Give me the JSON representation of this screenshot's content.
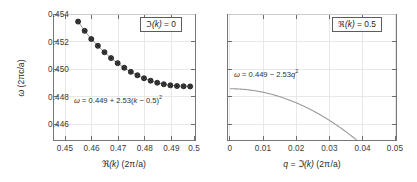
{
  "figure": {
    "background_color": "#ffffff",
    "frame_color": "#767676",
    "grid_color": "#e2e2e2",
    "marker_color": "#4a4a4a",
    "curve_color": "#9a9a9a"
  },
  "panels": {
    "left": {
      "legend_label": "ℑ(k) = 0",
      "equation": "ω = 0.449 + 2.53(k − 0.5)²",
      "xlabel_parts": {
        "frak": "ℜ",
        "rest": "(k) (2π /a)"
      },
      "xlabel": "ℜ(k) (2π /a)",
      "ylabel": "ω (2πc/a)",
      "xticks": [
        "0.45",
        "0.46",
        "0.47",
        "0.48",
        "0.49",
        "0.5"
      ],
      "yticks": [
        "0.446",
        "0.448",
        "0.450",
        "0.452",
        "0.454"
      ]
    },
    "right": {
      "legend_label": "ℜ(k) = 0.5",
      "equation": "ω = 0.449 − 2.53q²",
      "xlabel": "q = ℑ(k) (2π /a)",
      "ylabel": "",
      "xticks": [
        "0",
        "0.01",
        "0.02",
        "0.03",
        "0.04",
        "0.05"
      ],
      "yticks": [
        "",
        "",
        "",
        "",
        ""
      ]
    }
  },
  "chart_data": [
    {
      "type": "scatter",
      "title": "",
      "subtitle": "",
      "xlabel": "ℜ(k) (2π /a)",
      "ylabel": "ω (2πc/a)",
      "xlim": [
        0.4455,
        0.5015
      ],
      "ylim": [
        0.4452,
        0.45445
      ],
      "xticks": [
        0.45,
        0.46,
        0.47,
        0.48,
        0.49,
        0.5
      ],
      "yticks": [
        0.446,
        0.448,
        0.45,
        0.452,
        0.454
      ],
      "grid": true,
      "legend_position": "top-right",
      "legend_entries": [
        "ℑ(k) = 0"
      ],
      "annotations": [
        "ω = 0.449 + 2.53(k − 0.5)²"
      ],
      "fit_formula": "omega = 0.449 + 2.53*(k-0.5)^2",
      "series": [
        {
          "name": "dispersion",
          "marker": "filled-circle-with-cross",
          "x": [
            0.4552,
            0.4578,
            0.4604,
            0.463,
            0.4656,
            0.4682,
            0.4708,
            0.4734,
            0.476,
            0.4786,
            0.4812,
            0.4838,
            0.4864,
            0.489,
            0.4916,
            0.4942,
            0.4968,
            0.4994
          ],
          "y": [
            0.45393,
            0.45325,
            0.45265,
            0.45215,
            0.45168,
            0.45125,
            0.45088,
            0.45054,
            0.45024,
            0.44999,
            0.44977,
            0.44959,
            0.44944,
            0.44933,
            0.44925,
            0.4492,
            0.44918,
            0.44917
          ]
        }
      ]
    },
    {
      "type": "line",
      "title": "",
      "subtitle": "",
      "xlabel": "q = ℑ(k) (2π /a)",
      "ylabel": "",
      "xlim": [
        -0.0007,
        0.0507
      ],
      "ylim": [
        0.4452,
        0.45445
      ],
      "xticks": [
        0,
        0.01,
        0.02,
        0.03,
        0.04,
        0.05
      ],
      "yticks": [
        0.446,
        0.448,
        0.45,
        0.452,
        0.454
      ],
      "grid": true,
      "legend_position": "top-right",
      "legend_entries": [
        "ℜ(k) = 0.5"
      ],
      "annotations": [
        "ω = 0.449 − 2.53q²"
      ],
      "fit_formula": "omega = 0.449 - 2.53*q^2",
      "series": [
        {
          "name": "evanescent-branch",
          "x": [
            0,
            0.005,
            0.01,
            0.015,
            0.02,
            0.025,
            0.03,
            0.035,
            0.04,
            0.0415
          ],
          "y": [
            0.449,
            0.448937,
            0.448747,
            0.448431,
            0.447988,
            0.447419,
            0.446723,
            0.445901,
            0.444952,
            0.44464
          ]
        }
      ]
    }
  ]
}
